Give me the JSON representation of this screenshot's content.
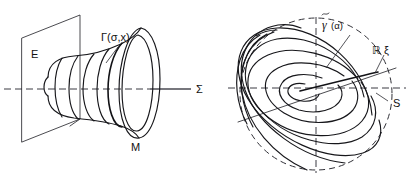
{
  "figure": {
    "width": 415,
    "height": 181,
    "background": "#ffffff",
    "ink_color": "#17171b",
    "dash_color": "#3b3b42"
  },
  "left_panel": {
    "name": "cone-bundle-diagram",
    "labels": {
      "plane": "E",
      "curve_family": "Γ(σ,x)",
      "manifold": "M",
      "axis": "Σ"
    }
  },
  "right_panel": {
    "name": "spiral-foliation-diagram",
    "labels": {
      "spiral": "γ̃(α)",
      "spiral_base": "γ",
      "spiral_arg": "(α)",
      "real_line": "ℝ ξ",
      "sphere": "S"
    }
  }
}
